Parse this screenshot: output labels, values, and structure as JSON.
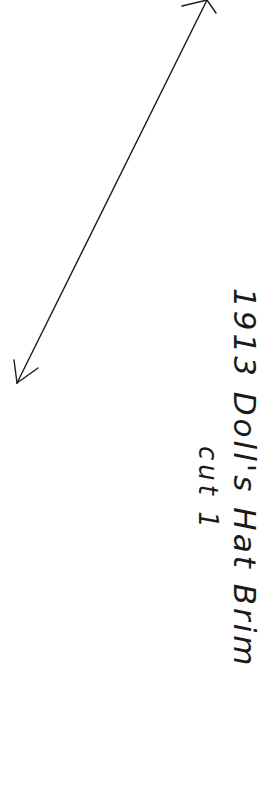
{
  "pattern_piece": {
    "title": "1913  Doll's Hat Brim",
    "instruction": "cut 1",
    "grainline": {
      "type": "double-headed-arrow",
      "start": [
        207,
        0
      ],
      "end": [
        17,
        383
      ],
      "color": "#1a1a1a"
    }
  }
}
